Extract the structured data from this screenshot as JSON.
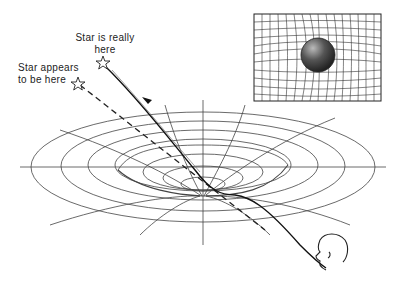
{
  "diagram": {
    "labels": {
      "real_star": [
        "Star is really",
        "here"
      ],
      "apparent_star": [
        "Star appears",
        "to be here"
      ]
    },
    "inset": {
      "description": "Sphere (mass) deforming a 2D grid (spacetime fabric)"
    },
    "elements": {
      "real_star_icon": "star-outline",
      "apparent_star_icon": "star-outline",
      "observer": "observer-head",
      "real_path": "solid curved light path",
      "apparent_path": "dashed straight line of sight"
    },
    "colors": {
      "ink": "#222222",
      "grid": "#444444",
      "sphere_dark": "#333333",
      "background": "#ffffff"
    }
  }
}
